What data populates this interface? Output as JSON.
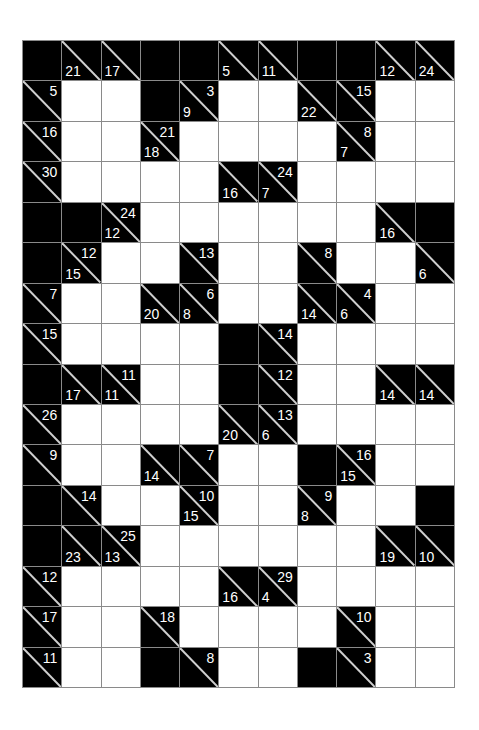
{
  "puzzle": {
    "type": "kakuro",
    "columns": 11,
    "rows": 16,
    "colors": {
      "black": "#000000",
      "white": "#ffffff",
      "grid_line": "#8a8a8a",
      "clue_text": "#ffffff"
    },
    "grid": [
      [
        {
          "t": "b"
        },
        {
          "t": "c",
          "d": 21
        },
        {
          "t": "c",
          "d": 17
        },
        {
          "t": "b"
        },
        {
          "t": "b"
        },
        {
          "t": "c",
          "d": 5
        },
        {
          "t": "c",
          "d": 11
        },
        {
          "t": "b"
        },
        {
          "t": "b"
        },
        {
          "t": "c",
          "d": 12
        },
        {
          "t": "c",
          "d": 24
        }
      ],
      [
        {
          "t": "c",
          "a": 5
        },
        {
          "t": "w"
        },
        {
          "t": "w"
        },
        {
          "t": "b"
        },
        {
          "t": "c",
          "d": 9,
          "a": 3
        },
        {
          "t": "w"
        },
        {
          "t": "w"
        },
        {
          "t": "c",
          "d": 22
        },
        {
          "t": "c",
          "a": 15
        },
        {
          "t": "w"
        },
        {
          "t": "w"
        }
      ],
      [
        {
          "t": "c",
          "a": 16
        },
        {
          "t": "w"
        },
        {
          "t": "w"
        },
        {
          "t": "c",
          "d": 18,
          "a": 21
        },
        {
          "t": "w"
        },
        {
          "t": "w"
        },
        {
          "t": "w"
        },
        {
          "t": "w"
        },
        {
          "t": "c",
          "d": 7,
          "a": 8
        },
        {
          "t": "w"
        },
        {
          "t": "w"
        }
      ],
      [
        {
          "t": "c",
          "a": 30
        },
        {
          "t": "w"
        },
        {
          "t": "w"
        },
        {
          "t": "w"
        },
        {
          "t": "w"
        },
        {
          "t": "c",
          "d": 16
        },
        {
          "t": "c",
          "d": 7,
          "a": 24
        },
        {
          "t": "w"
        },
        {
          "t": "w"
        },
        {
          "t": "w"
        },
        {
          "t": "w"
        }
      ],
      [
        {
          "t": "b"
        },
        {
          "t": "b"
        },
        {
          "t": "c",
          "d": 12,
          "a": 24
        },
        {
          "t": "w"
        },
        {
          "t": "w"
        },
        {
          "t": "w"
        },
        {
          "t": "w"
        },
        {
          "t": "w"
        },
        {
          "t": "w"
        },
        {
          "t": "c",
          "d": 16
        },
        {
          "t": "b"
        }
      ],
      [
        {
          "t": "b"
        },
        {
          "t": "c",
          "d": 15,
          "a": 12
        },
        {
          "t": "w"
        },
        {
          "t": "w"
        },
        {
          "t": "c",
          "a": 13
        },
        {
          "t": "w"
        },
        {
          "t": "w"
        },
        {
          "t": "c",
          "a": 8
        },
        {
          "t": "w"
        },
        {
          "t": "w"
        },
        {
          "t": "c",
          "d": 6
        }
      ],
      [
        {
          "t": "c",
          "a": 7
        },
        {
          "t": "w"
        },
        {
          "t": "w"
        },
        {
          "t": "c",
          "d": 20
        },
        {
          "t": "c",
          "d": 8,
          "a": 6
        },
        {
          "t": "w"
        },
        {
          "t": "w"
        },
        {
          "t": "c",
          "d": 14
        },
        {
          "t": "c",
          "d": 6,
          "a": 4
        },
        {
          "t": "w"
        },
        {
          "t": "w"
        }
      ],
      [
        {
          "t": "c",
          "a": 15
        },
        {
          "t": "w"
        },
        {
          "t": "w"
        },
        {
          "t": "w"
        },
        {
          "t": "w"
        },
        {
          "t": "b"
        },
        {
          "t": "c",
          "a": 14
        },
        {
          "t": "w"
        },
        {
          "t": "w"
        },
        {
          "t": "w"
        },
        {
          "t": "w"
        }
      ],
      [
        {
          "t": "b"
        },
        {
          "t": "c",
          "d": 17
        },
        {
          "t": "c",
          "d": 11,
          "a": 11
        },
        {
          "t": "w"
        },
        {
          "t": "w"
        },
        {
          "t": "b"
        },
        {
          "t": "c",
          "a": 12
        },
        {
          "t": "w"
        },
        {
          "t": "w"
        },
        {
          "t": "c",
          "d": 14
        },
        {
          "t": "c",
          "d": 14
        }
      ],
      [
        {
          "t": "c",
          "a": 26
        },
        {
          "t": "w"
        },
        {
          "t": "w"
        },
        {
          "t": "w"
        },
        {
          "t": "w"
        },
        {
          "t": "c",
          "d": 20
        },
        {
          "t": "c",
          "d": 6,
          "a": 13
        },
        {
          "t": "w"
        },
        {
          "t": "w"
        },
        {
          "t": "w"
        },
        {
          "t": "w"
        }
      ],
      [
        {
          "t": "c",
          "a": 9
        },
        {
          "t": "w"
        },
        {
          "t": "w"
        },
        {
          "t": "c",
          "d": 14
        },
        {
          "t": "c",
          "a": 7
        },
        {
          "t": "w"
        },
        {
          "t": "w"
        },
        {
          "t": "b"
        },
        {
          "t": "c",
          "d": 15,
          "a": 16
        },
        {
          "t": "w"
        },
        {
          "t": "w"
        }
      ],
      [
        {
          "t": "b"
        },
        {
          "t": "c",
          "a": 14
        },
        {
          "t": "w"
        },
        {
          "t": "w"
        },
        {
          "t": "c",
          "d": 15,
          "a": 10
        },
        {
          "t": "w"
        },
        {
          "t": "w"
        },
        {
          "t": "c",
          "d": 8,
          "a": 9
        },
        {
          "t": "w"
        },
        {
          "t": "w"
        },
        {
          "t": "b"
        }
      ],
      [
        {
          "t": "b"
        },
        {
          "t": "c",
          "d": 23
        },
        {
          "t": "c",
          "d": 13,
          "a": 25
        },
        {
          "t": "w"
        },
        {
          "t": "w"
        },
        {
          "t": "w"
        },
        {
          "t": "w"
        },
        {
          "t": "w"
        },
        {
          "t": "w"
        },
        {
          "t": "c",
          "d": 19
        },
        {
          "t": "c",
          "d": 10
        }
      ],
      [
        {
          "t": "c",
          "a": 12
        },
        {
          "t": "w"
        },
        {
          "t": "w"
        },
        {
          "t": "w"
        },
        {
          "t": "w"
        },
        {
          "t": "c",
          "d": 16
        },
        {
          "t": "c",
          "d": 4,
          "a": 29
        },
        {
          "t": "w"
        },
        {
          "t": "w"
        },
        {
          "t": "w"
        },
        {
          "t": "w"
        }
      ],
      [
        {
          "t": "c",
          "a": 17
        },
        {
          "t": "w"
        },
        {
          "t": "w"
        },
        {
          "t": "c",
          "a": 18
        },
        {
          "t": "w"
        },
        {
          "t": "w"
        },
        {
          "t": "w"
        },
        {
          "t": "w"
        },
        {
          "t": "c",
          "a": 10
        },
        {
          "t": "w"
        },
        {
          "t": "w"
        }
      ],
      [
        {
          "t": "c",
          "a": 11
        },
        {
          "t": "w"
        },
        {
          "t": "w"
        },
        {
          "t": "b"
        },
        {
          "t": "c",
          "a": 8
        },
        {
          "t": "w"
        },
        {
          "t": "w"
        },
        {
          "t": "b"
        },
        {
          "t": "c",
          "a": 3
        },
        {
          "t": "w"
        },
        {
          "t": "w"
        }
      ]
    ]
  }
}
